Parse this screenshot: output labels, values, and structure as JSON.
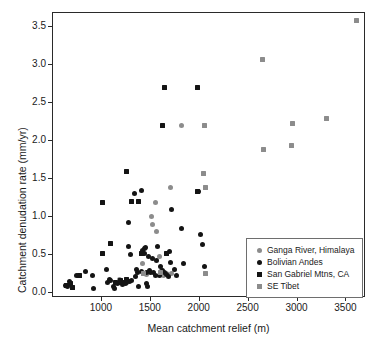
{
  "chart_data": {
    "type": "scatter",
    "title": "",
    "xlabel": "Mean catchment relief (m)",
    "ylabel": "Catchment denudation rate (mm/yr)",
    "xlim": [
      500,
      3700
    ],
    "ylim": [
      -0.07,
      3.68
    ],
    "xticks": [
      1000,
      1500,
      2000,
      2500,
      3000,
      3500
    ],
    "xticklabels": [
      "1000",
      "1500",
      "2000",
      "2500",
      "3000",
      "3500"
    ],
    "yticks": [
      0.0,
      0.5,
      1.0,
      1.5,
      2.0,
      2.5,
      3.0,
      3.5
    ],
    "yticklabels": [
      "0.0",
      "0.5",
      "1.0",
      "1.5",
      "2.0",
      "2.5",
      "3.0",
      "3.5"
    ],
    "grid": false,
    "legend_position": "lower-right",
    "series": [
      {
        "name": "Ganga River, Himalaya",
        "marker": "circle",
        "color": "#8c8c8c",
        "points": [
          [
            1175,
            0.17
          ],
          [
            1420,
            0.39
          ],
          [
            1455,
            0.24
          ],
          [
            1510,
            1.0
          ],
          [
            1520,
            0.9
          ],
          [
            1545,
            1.19
          ],
          [
            1560,
            0.8
          ],
          [
            1585,
            0.48
          ],
          [
            1605,
            0.29
          ],
          [
            1630,
            0.22
          ],
          [
            1660,
            0.25
          ],
          [
            1700,
            1.39
          ],
          [
            1715,
            0.25
          ],
          [
            1810,
            2.2
          ]
        ]
      },
      {
        "name": "Bolivian Andes",
        "marker": "circle",
        "color": "#141414",
        "points": [
          [
            630,
            0.1
          ],
          [
            645,
            0.08
          ],
          [
            665,
            0.15
          ],
          [
            745,
            0.23
          ],
          [
            835,
            0.28
          ],
          [
            905,
            0.23
          ],
          [
            915,
            0.05
          ],
          [
            1045,
            0.31
          ],
          [
            1055,
            0.13
          ],
          [
            1075,
            0.17
          ],
          [
            1090,
            0.16
          ],
          [
            1115,
            0.08
          ],
          [
            1125,
            0.06
          ],
          [
            1155,
            0.12
          ],
          [
            1175,
            0.13
          ],
          [
            1190,
            0.15
          ],
          [
            1215,
            0.11
          ],
          [
            1240,
            0.12
          ],
          [
            1255,
            0.14
          ],
          [
            1270,
            0.93
          ],
          [
            1275,
            0.61
          ],
          [
            1285,
            0.15
          ],
          [
            1290,
            0.5
          ],
          [
            1305,
            0.16
          ],
          [
            1330,
            1.3
          ],
          [
            1340,
            0.21
          ],
          [
            1355,
            0.3
          ],
          [
            1365,
            0.27
          ],
          [
            1375,
            0.08
          ],
          [
            1400,
            1.35
          ],
          [
            1405,
            0.28
          ],
          [
            1420,
            0.55
          ],
          [
            1435,
            0.52
          ],
          [
            1440,
            0.58
          ],
          [
            1450,
            0.6
          ],
          [
            1455,
            0.26
          ],
          [
            1460,
            0.12
          ],
          [
            1465,
            0.08
          ],
          [
            1475,
            0.47
          ],
          [
            1490,
            0.29
          ],
          [
            1500,
            0.27
          ],
          [
            1520,
            0.45
          ],
          [
            1530,
            0.26
          ],
          [
            1545,
            0.23
          ],
          [
            1560,
            0.42
          ],
          [
            1570,
            0.61
          ],
          [
            1585,
            0.22
          ],
          [
            1600,
            0.34
          ],
          [
            1620,
            0.29
          ],
          [
            1640,
            0.27
          ],
          [
            1660,
            0.24
          ],
          [
            1680,
            0.21
          ],
          [
            1690,
            0.54
          ],
          [
            1700,
            0.4
          ],
          [
            1710,
            1.09
          ],
          [
            1740,
            0.31
          ],
          [
            1760,
            0.22
          ],
          [
            1815,
            0.84
          ],
          [
            1830,
            0.38
          ],
          [
            1985,
            1.33
          ],
          [
            2010,
            0.76
          ],
          [
            2030,
            0.63
          ],
          [
            2045,
            0.34
          ]
        ]
      },
      {
        "name": "San Gabriel Mtns, CA",
        "marker": "square",
        "color": "#141414",
        "points": [
          [
            640,
            0.09
          ],
          [
            680,
            0.12
          ],
          [
            700,
            0.07
          ],
          [
            770,
            0.22
          ],
          [
            1005,
            0.52
          ],
          [
            1010,
            1.19
          ],
          [
            1090,
            0.65
          ],
          [
            1140,
            0.14
          ],
          [
            1185,
            0.16
          ],
          [
            1225,
            0.13
          ],
          [
            1250,
            1.59
          ],
          [
            1255,
            0.18
          ],
          [
            1305,
            1.2
          ],
          [
            1370,
            1.2
          ],
          [
            1400,
            0.52
          ],
          [
            1665,
            0.52
          ],
          [
            1640,
            2.7
          ],
          [
            1620,
            2.2
          ],
          [
            1975,
            2.7
          ],
          [
            1980,
            1.33
          ]
        ]
      },
      {
        "name": "SE Tibet",
        "marker": "square",
        "color": "#8c8c8c",
        "points": [
          [
            1430,
            0.25
          ],
          [
            1595,
            0.27
          ],
          [
            2040,
            1.57
          ],
          [
            2055,
            1.39
          ],
          [
            2050,
            2.2
          ],
          [
            2055,
            0.25
          ],
          [
            2640,
            3.07
          ],
          [
            2650,
            1.89
          ],
          [
            2940,
            1.94
          ],
          [
            2950,
            2.22
          ],
          [
            3300,
            2.29
          ],
          [
            3605,
            3.58
          ]
        ]
      }
    ]
  },
  "axes": {
    "x_label": "Mean catchment relief (m)",
    "y_label": "Catchment denudation rate (mm/yr)"
  },
  "legend": {
    "items": [
      {
        "label": "Ganga River, Himalaya",
        "marker": "circle",
        "color": "#8c8c8c"
      },
      {
        "label": "Bolivian Andes",
        "marker": "circle",
        "color": "#141414"
      },
      {
        "label": "San Gabriel Mtns, CA",
        "marker": "square",
        "color": "#141414"
      },
      {
        "label": "SE Tibet",
        "marker": "square",
        "color": "#8c8c8c"
      }
    ]
  }
}
